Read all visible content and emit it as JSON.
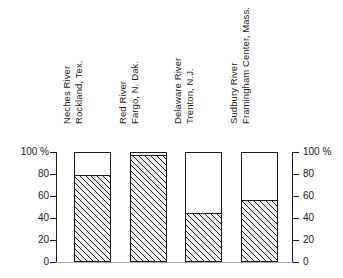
{
  "chart_data": {
    "type": "bar",
    "title": "",
    "subtitle": "",
    "xlabel": "",
    "ylabel": "",
    "ylim": [
      0,
      100
    ],
    "unit": "%",
    "grid": false,
    "legend": null,
    "orientation": "vertical",
    "note": "Partial-fill bars: hatched portion of each full 100% outlined bar",
    "categories": [
      "Neches River Rockland, Tex.",
      "Red River Fargo, N. Dak.",
      "Delaware River Trenton, N.J.",
      "Sudbury River Framingham Center, Mass."
    ],
    "category_lines": [
      [
        "Neches River",
        "Rockland, Tex."
      ],
      [
        "Red River",
        "Fargo, N. Dak."
      ],
      [
        "Delaware River",
        "Trenton, N.J."
      ],
      [
        "Sudbury River",
        "Framingham Center, Mass."
      ]
    ],
    "values": [
      79,
      97,
      45,
      56
    ],
    "remainder_values": [
      21,
      3,
      55,
      44
    ],
    "axis_left": {
      "labels": [
        "100 %",
        "80",
        "60",
        "40",
        "20",
        "0"
      ],
      "values": [
        100,
        80,
        60,
        40,
        20,
        0
      ]
    },
    "axis_right": {
      "labels": [
        "100 %",
        "80",
        "60",
        "40",
        "20",
        "0"
      ],
      "values": [
        100,
        80,
        60,
        40,
        20,
        0
      ]
    },
    "colors": {
      "outline": "#1a1a1a",
      "fill_hatch": "#1a1a1a",
      "fill_background": "#f2f2f2",
      "empty": "#ffffff",
      "baseline": "#a8a8a8",
      "background": "#ffffff"
    }
  }
}
